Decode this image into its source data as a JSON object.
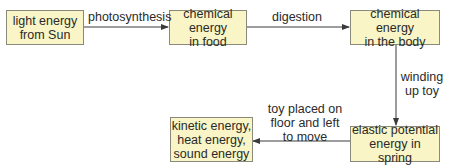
{
  "diagram": {
    "type": "energy-flow",
    "nodes": [
      {
        "id": "sun",
        "text": "light energy\nfrom Sun"
      },
      {
        "id": "food",
        "text": "chemical energy\nin food"
      },
      {
        "id": "body",
        "text": "chemical energy\nin the body"
      },
      {
        "id": "spring",
        "text": "elastic potential\nenergy in spring"
      },
      {
        "id": "output",
        "text": "kinetic energy,\nheat energy,\nsound energy"
      }
    ],
    "edges": [
      {
        "from": "sun",
        "to": "food",
        "label": "photosynthesis"
      },
      {
        "from": "food",
        "to": "body",
        "label": "digestion"
      },
      {
        "from": "body",
        "to": "spring",
        "label": "winding\nup toy"
      },
      {
        "from": "spring",
        "to": "output",
        "label": "toy placed on\nfloor and left\nto move"
      }
    ],
    "colors": {
      "box_fill": "#f9f5c6",
      "box_border": "#8a8a7a",
      "arrow": "#3a3a3a"
    }
  }
}
